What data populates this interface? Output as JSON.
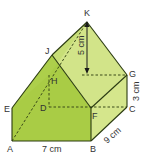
{
  "diagram": {
    "type": "3d-solid-house-prism",
    "colors": {
      "front_face": "#a9cc45",
      "left_roof": "#b5d457",
      "right_face": "#d5e68c",
      "right_roof": "#d2e489",
      "edge": "#2a3a10",
      "hidden_edge": "#3a4a18"
    },
    "vertices": {
      "A": "A",
      "B": "B",
      "C": "C",
      "D": "D",
      "E": "E",
      "F": "F",
      "G": "G",
      "H": "H",
      "J": "J",
      "K": "K"
    },
    "dimensions": {
      "ab": "7 cm",
      "bc": "9 cm",
      "cg": "3 cm",
      "height": "5 cm"
    }
  }
}
